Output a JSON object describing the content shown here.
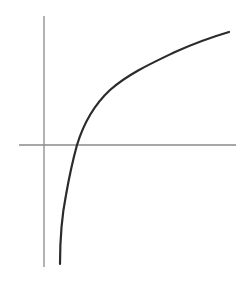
{
  "chart_data": {
    "type": "line",
    "title": "",
    "xlabel": "",
    "ylabel": "",
    "grid": false,
    "legend": null,
    "series": [
      {
        "name": "y = ln(x)",
        "x": [
          0.48,
          0.55,
          0.64,
          0.79,
          1.0,
          1.09,
          1.55,
          2.0,
          2.6,
          3.2,
          4.0,
          4.7,
          5.5
        ],
        "y": [
          -1.82,
          -1.29,
          -0.83,
          -0.45,
          0.0,
          0.11,
          0.56,
          0.83,
          1.05,
          1.2,
          1.41,
          1.56,
          1.71
        ]
      }
    ],
    "xlim": [
      -0.75,
      5.8
    ],
    "ylim": [
      -1.85,
      1.95
    ],
    "colors": {
      "curve": "#2b2b2b",
      "axes": "#8a8a8a",
      "background": "#ffffff"
    }
  },
  "geometry": {
    "x_axis": {
      "x1": 19,
      "y1": 145,
      "x2": 236,
      "y2": 145
    },
    "y_axis": {
      "x1": 44,
      "y1": 16,
      "x2": 44,
      "y2": 267
    },
    "curve_path": "M 60 264 C 60 240, 62 215, 66 195 C 69 178, 72 163, 77 145 C 84 122, 95 104, 110 90 C 128 74, 150 64, 175 52 C 195 43, 212 37, 229 32"
  }
}
